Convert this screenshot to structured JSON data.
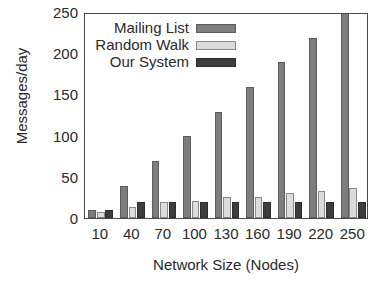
{
  "chart_data": {
    "type": "bar",
    "title": "",
    "subtitle": "",
    "xlabel": "Network Size (Nodes)",
    "ylabel": "Messages/day",
    "categories": [
      "10",
      "40",
      "70",
      "100",
      "130",
      "160",
      "190",
      "220",
      "250"
    ],
    "series": [
      {
        "name": "Mailing List",
        "color": "#7d7d7d",
        "values": [
          10,
          39,
          69,
          99,
          129,
          159,
          189,
          219,
          250
        ]
      },
      {
        "name": "Random Walk",
        "color": "#dcdcdc",
        "values": [
          7,
          13,
          19,
          21,
          26,
          26,
          30,
          33,
          36
        ]
      },
      {
        "name": "Our System",
        "color": "#3d3d3d",
        "values": [
          10,
          20,
          20,
          20,
          20,
          20,
          20,
          20,
          20
        ]
      }
    ],
    "ylim": [
      0,
      250
    ],
    "yticks": [
      0,
      50,
      100,
      150,
      200,
      250
    ],
    "ytick_labels": [
      "0",
      "50",
      "100",
      "150",
      "200",
      "250"
    ],
    "grid": false,
    "legend_position": "top-left"
  },
  "legend": {
    "entries": [
      {
        "label": "Mailing List"
      },
      {
        "label": "Random Walk"
      },
      {
        "label": "Our System"
      }
    ]
  }
}
